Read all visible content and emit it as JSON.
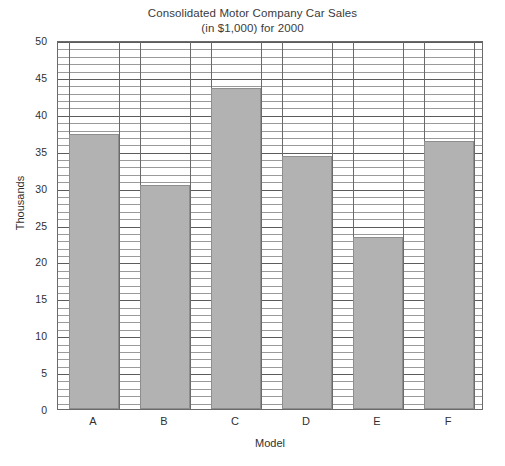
{
  "chart_data": {
    "type": "bar",
    "title": "Consolidated Motor Company Car Sales",
    "subtitle": "(in $1,000) for 2000",
    "xlabel": "Model",
    "ylabel": "Thousands",
    "categories": [
      "A",
      "B",
      "C",
      "D",
      "E",
      "F"
    ],
    "values": [
      37.3,
      30.3,
      43.5,
      34.3,
      23.3,
      36.3
    ],
    "ylim": [
      0,
      50
    ],
    "y_major_ticks": [
      0,
      5,
      10,
      15,
      20,
      25,
      30,
      35,
      40,
      45,
      50
    ],
    "y_tick_labels": [
      "0",
      "5",
      "10",
      "15",
      "20",
      "25",
      "30",
      "35",
      "40",
      "45",
      "50"
    ],
    "y_minor_tick_step": 1,
    "grid": true,
    "grid_axis": "both",
    "legend": false,
    "bar_color": "#b2b2b2",
    "bar_border_color": "#8e8e8e",
    "plot_background": "#ffffff",
    "grid_major_color": "#5c5c5c",
    "grid_minor_color": "#9a9a9a",
    "frame_color": "#6a6a6a"
  }
}
